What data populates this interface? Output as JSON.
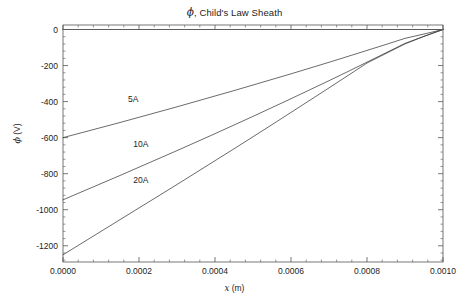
{
  "figure": {
    "title_phi": "ϕ",
    "title_rest": ", Child's Law Sheath",
    "title_full": "ϕ, Child's Law Sheath",
    "background_color": "#ffffff",
    "frame_color": "#555555",
    "curve_color": "#3a3a3a"
  },
  "axes": {
    "x": {
      "label_var": "x",
      "label_unit": " (m)",
      "label_full": "x (m)",
      "ticks": [
        "0.0000",
        "0.0002",
        "0.0004",
        "0.0006",
        "0.0008",
        "0.0010"
      ],
      "tick_values": [
        0.0,
        0.0002,
        0.0004,
        0.0006,
        0.0008,
        0.001
      ],
      "range": [
        0.0,
        0.001
      ],
      "minor_ticks_per_interval": 4
    },
    "y": {
      "label_phi": "ϕ",
      "label_unit": " (V)",
      "label_full": "ϕ (V)",
      "ticks": [
        "0",
        "-200",
        "-400",
        "-600",
        "-800",
        "-1000",
        "-1200"
      ],
      "tick_values": [
        0,
        -200,
        -400,
        -600,
        -800,
        -1000,
        -1200
      ],
      "range": [
        -1290,
        25
      ],
      "minor_ticks_per_interval": 4
    }
  },
  "chart_data": {
    "type": "line",
    "title": "ϕ, Child's Law Sheath",
    "xlabel": "x (m)",
    "ylabel": "ϕ (V)",
    "xlim": [
      0.0,
      0.001
    ],
    "ylim": [
      -1290,
      25
    ],
    "grid": false,
    "legend": "inline-curve-labels",
    "x": [
      0.0,
      5e-05,
      0.0001,
      0.00015,
      0.0002,
      0.00025,
      0.0003,
      0.00035,
      0.0004,
      0.00045,
      0.0005,
      0.00055,
      0.0006,
      0.00065,
      0.0007,
      0.00075,
      0.0008,
      0.00085,
      0.0009,
      0.00095,
      0.001
    ],
    "series": [
      {
        "name": "5A",
        "label": "5A",
        "color": "#3a3a3a",
        "values": [
          -600,
          -572,
          -544,
          -516,
          -487,
          -458,
          -429,
          -399,
          -369,
          -339,
          -308,
          -277,
          -246,
          -214,
          -182,
          -149,
          -116,
          -83,
          -49,
          -25,
          0
        ]
      },
      {
        "name": "10A",
        "label": "10A",
        "color": "#3a3a3a",
        "values": [
          -945,
          -900,
          -855,
          -810,
          -764,
          -718,
          -672,
          -625,
          -578,
          -530,
          -482,
          -433,
          -384,
          -334,
          -284,
          -233,
          -181,
          -129,
          -77,
          -38,
          0
        ]
      },
      {
        "name": "20A",
        "label": "20A",
        "color": "#3a3a3a",
        "values": [
          -1250,
          -1185,
          -1120,
          -1055,
          -990,
          -925,
          -860,
          -794,
          -728,
          -662,
          -595,
          -528,
          -460,
          -392,
          -324,
          -255,
          -186,
          -133,
          -80,
          -38,
          0
        ]
      },
      {
        "name": "zero-reference",
        "label": "",
        "color": "#5a5a5a",
        "values": [
          0,
          0,
          0,
          0,
          0,
          0,
          0,
          0,
          0,
          0,
          0,
          0,
          0,
          0,
          0,
          0,
          0,
          0,
          0,
          0,
          0
        ]
      }
    ],
    "curve_labels": [
      {
        "text": "5A",
        "x": 0.000185,
        "y": -385
      },
      {
        "text": "10A",
        "x": 0.000205,
        "y": -635
      },
      {
        "text": "20A",
        "x": 0.000205,
        "y": -835
      }
    ]
  }
}
